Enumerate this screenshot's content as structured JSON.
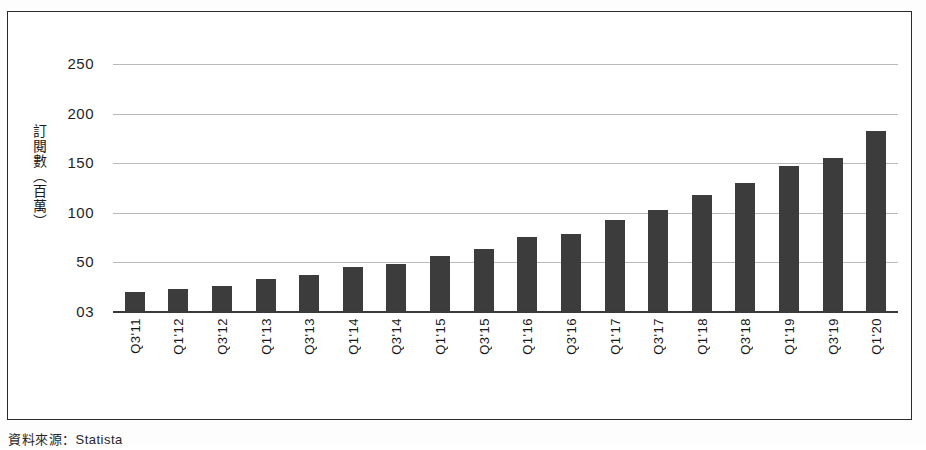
{
  "chart_data": {
    "type": "bar",
    "title": "",
    "subtitle": "",
    "xlabel": "",
    "ylabel": "訂閱數（百萬）",
    "ylim": [
      0,
      250
    ],
    "yticks": [
      "03",
      "50",
      "100",
      "150",
      "200",
      "250"
    ],
    "ytick_values": [
      0,
      50,
      100,
      150,
      200,
      250
    ],
    "grid": true,
    "legend": null,
    "bar_color": "#3c3c3c",
    "categories": [
      "Q3'11",
      "Q1'12",
      "Q3'12",
      "Q1'13",
      "Q3'13",
      "Q1'14",
      "Q3'14",
      "Q1'15",
      "Q3'15",
      "Q1'16",
      "Q3'16",
      "Q1'17",
      "Q3'17",
      "Q1'18",
      "Q3'18",
      "Q1'19",
      "Q3'19",
      "Q1'20"
    ],
    "values": [
      20,
      23,
      26,
      33,
      37,
      45,
      48,
      56,
      64,
      76,
      79,
      93,
      103,
      118,
      130,
      147,
      155,
      182
    ]
  },
  "caption": {
    "source": "資料來源：Statista"
  }
}
